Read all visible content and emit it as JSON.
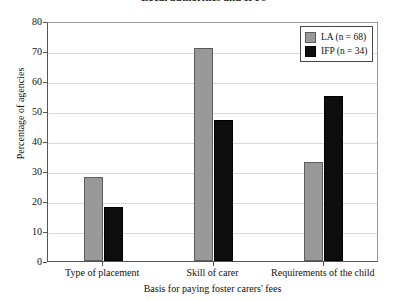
{
  "title": {
    "text": "Local authorities and IFPs",
    "clipped": true
  },
  "chart_data": {
    "type": "bar",
    "title": "Local authorities and IFPs",
    "xlabel": "Basis for paying foster carers' fees",
    "ylabel": "Percentage of agencies",
    "categories": [
      "Type of placement",
      "Skill of carer",
      "Requirements of the child"
    ],
    "series": [
      {
        "name": "LA (n = 68)",
        "color": "#999999",
        "values": [
          28,
          71,
          33
        ]
      },
      {
        "name": "IFP (n = 34)",
        "color": "#0d0d0d",
        "values": [
          18,
          47,
          55
        ]
      }
    ],
    "ylim": [
      0,
      80
    ],
    "ytick_labels": [
      "80",
      "70",
      "60",
      "50",
      "40",
      "30",
      "20",
      "10",
      "0"
    ],
    "ytick_values": [
      80,
      70,
      60,
      50,
      40,
      30,
      20,
      10,
      0
    ],
    "grid": true,
    "legend_position": "top-right"
  },
  "legend": {
    "items": [
      {
        "label": "LA (n = 68)",
        "swatch": "la"
      },
      {
        "label": "IFP (n = 34)",
        "swatch": "ifp"
      }
    ]
  }
}
